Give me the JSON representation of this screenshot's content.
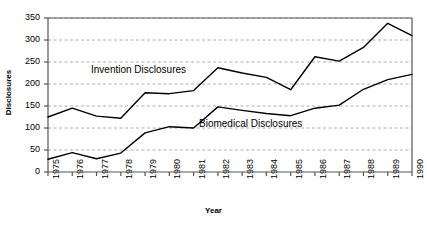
{
  "chart_data": {
    "type": "line",
    "title": "",
    "xlabel": "Year",
    "ylabel": "Disclosures",
    "categories": [
      "1975",
      "1976",
      "1977",
      "1978",
      "1979",
      "1980",
      "1981",
      "1982",
      "1983",
      "1984",
      "1985",
      "1986",
      "1987",
      "1988",
      "1989",
      "1990"
    ],
    "ylim": [
      0,
      350
    ],
    "ytick_labels": [
      "0",
      "50",
      "100",
      "150",
      "200",
      "250",
      "300",
      "350"
    ],
    "ytick_values": [
      0,
      50,
      100,
      150,
      200,
      250,
      300,
      350
    ],
    "grid": true,
    "grid_style": "dashed-horizontal",
    "grid_color": "#999999",
    "legend_position": "inline-annotation",
    "series": [
      {
        "name": "Invention Disclosures",
        "color": "#000000",
        "values": [
          125,
          145,
          127,
          122,
          180,
          178,
          185,
          237,
          225,
          215,
          187,
          262,
          252,
          283,
          338,
          310
        ]
      },
      {
        "name": "Biomedical Disclosures",
        "color": "#000000",
        "values": [
          29,
          44,
          30,
          43,
          89,
          103,
          100,
          148,
          140,
          133,
          128,
          145,
          152,
          188,
          210,
          222
        ]
      }
    ],
    "annotations": [
      {
        "text": "Invention Disclosures"
      },
      {
        "text": "Biomedical Disclosures"
      }
    ]
  }
}
